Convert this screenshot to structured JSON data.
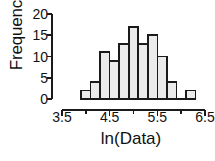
{
  "chart_data": {
    "type": "bar",
    "title": "",
    "subtitle": "",
    "xlabel": "ln(Data)",
    "ylabel": "Frequency",
    "xlim": [
      3.5,
      6.5
    ],
    "ylim": [
      0,
      20
    ],
    "grid": false,
    "legend": null,
    "bin_width": 0.2,
    "bin_starts": [
      3.9,
      4.1,
      4.3,
      4.5,
      4.7,
      4.9,
      5.1,
      5.3,
      5.5,
      5.7,
      5.9,
      6.1
    ],
    "categories": [
      "3.9-4.1",
      "4.1-4.3",
      "4.3-4.5",
      "4.5-4.7",
      "4.7-4.9",
      "4.9-5.1",
      "5.1-5.3",
      "5.3-5.5",
      "5.5-5.7",
      "5.7-5.9",
      "5.9-6.1",
      "6.1-6.3"
    ],
    "values": [
      2,
      4,
      11,
      9,
      13,
      17,
      13,
      15,
      10,
      4,
      0,
      2
    ],
    "x_major_ticks": [
      3.5,
      4.5,
      5.5,
      6.5
    ],
    "x_minor_ticks": [
      4.0,
      5.0,
      6.0
    ],
    "x_tick_labels": [
      "3.5",
      "4.5",
      "5.5",
      "6.5"
    ],
    "y_ticks": [
      0,
      5,
      10,
      15,
      20
    ],
    "y_tick_labels": [
      "0",
      "5",
      "10",
      "15",
      "20"
    ],
    "bar_fill": "#ebebeb",
    "bar_stroke": "#1a1a1a",
    "axis_color": "#1a1a1a"
  }
}
